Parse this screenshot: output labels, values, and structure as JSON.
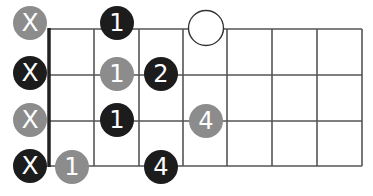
{
  "diagram": {
    "type": "fretboard-chord-diagram",
    "frets_shown": 7,
    "strings_shown": 4,
    "colors": {
      "black": "#1c1c1c",
      "gray": "#8c8c8c",
      "line": "#555555",
      "nut": "#222222",
      "label": "#ffffff"
    },
    "markers": [
      {
        "id": "s1-mute",
        "label": "X",
        "string": 1,
        "kind": "muted",
        "color": "gray",
        "cx": 30,
        "cy": 23
      },
      {
        "id": "s2-mute",
        "label": "X",
        "string": 2,
        "kind": "muted",
        "color": "black",
        "cx": 30,
        "cy": 73
      },
      {
        "id": "s3-mute",
        "label": "X",
        "string": 3,
        "kind": "muted",
        "color": "gray",
        "cx": 30,
        "cy": 120
      },
      {
        "id": "s4-mute",
        "label": "X",
        "string": 4,
        "kind": "muted",
        "color": "black",
        "cx": 30,
        "cy": 166
      },
      {
        "id": "s1-f2",
        "label": "1",
        "string": 1,
        "fret": 2,
        "kind": "finger",
        "color": "black",
        "cx": 117,
        "cy": 23
      },
      {
        "id": "s2-f2",
        "label": "1",
        "string": 2,
        "fret": 2,
        "kind": "finger",
        "color": "gray",
        "cx": 117,
        "cy": 74
      },
      {
        "id": "s2-f3",
        "label": "2",
        "string": 2,
        "fret": 3,
        "kind": "finger",
        "color": "black",
        "cx": 161,
        "cy": 74
      },
      {
        "id": "s3-f2",
        "label": "1",
        "string": 3,
        "fret": 2,
        "kind": "finger",
        "color": "black",
        "cx": 117,
        "cy": 120
      },
      {
        "id": "s3-f4",
        "label": "4",
        "string": 3,
        "fret": 4,
        "kind": "finger",
        "color": "gray",
        "cx": 206,
        "cy": 121
      },
      {
        "id": "s4-f1",
        "label": "1",
        "string": 4,
        "fret": 1,
        "kind": "finger",
        "color": "gray",
        "cx": 72,
        "cy": 167
      },
      {
        "id": "s4-f3",
        "label": "4",
        "string": 4,
        "fret": 3,
        "kind": "finger",
        "color": "black",
        "cx": 161,
        "cy": 167
      },
      {
        "id": "s1-open-target",
        "label": "",
        "string": 1,
        "fret": 4,
        "kind": "open-circle",
        "color": "none",
        "cx": 206,
        "cy": 28
      }
    ]
  }
}
